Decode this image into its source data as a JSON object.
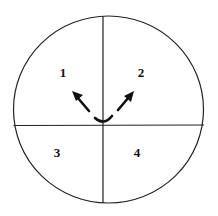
{
  "diagram": {
    "type": "quadrant-circle",
    "stroke_color": "#222222",
    "quadrants": [
      {
        "id": 1,
        "label": "1",
        "x": 63,
        "y": 77
      },
      {
        "id": 2,
        "label": "2",
        "x": 141,
        "y": 77
      },
      {
        "id": 3,
        "label": "3",
        "x": 57,
        "y": 157
      },
      {
        "id": 4,
        "label": "4",
        "x": 137,
        "y": 157
      }
    ],
    "arrows": [
      {
        "name": "arrow-to-quadrant-1",
        "direction": "up-left"
      },
      {
        "name": "arrow-to-quadrant-2",
        "direction": "up-right"
      }
    ]
  }
}
